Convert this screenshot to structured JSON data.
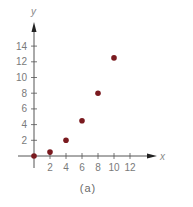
{
  "chart_data": {
    "type": "scatter",
    "title": "",
    "caption": "(a)",
    "xlabel": "x",
    "ylabel": "y",
    "xlim": [
      -2,
      15
    ],
    "ylim": [
      -1.5,
      17
    ],
    "x_ticks": [
      2,
      4,
      6,
      8,
      10,
      12
    ],
    "y_ticks": [
      2,
      4,
      6,
      8,
      10,
      12,
      14
    ],
    "grid": false,
    "legend": null,
    "series": [
      {
        "name": "points",
        "color": "#7a1a1f",
        "points": [
          {
            "x": 0,
            "y": 0
          },
          {
            "x": 2,
            "y": 0.5
          },
          {
            "x": 4,
            "y": 2
          },
          {
            "x": 6,
            "y": 4.5
          },
          {
            "x": 8,
            "y": 8
          },
          {
            "x": 10,
            "y": 12.5
          }
        ]
      }
    ]
  },
  "colors": {
    "axis": "#555555",
    "tick_label": "#7a7a7a",
    "point": "#7a1a1f"
  }
}
